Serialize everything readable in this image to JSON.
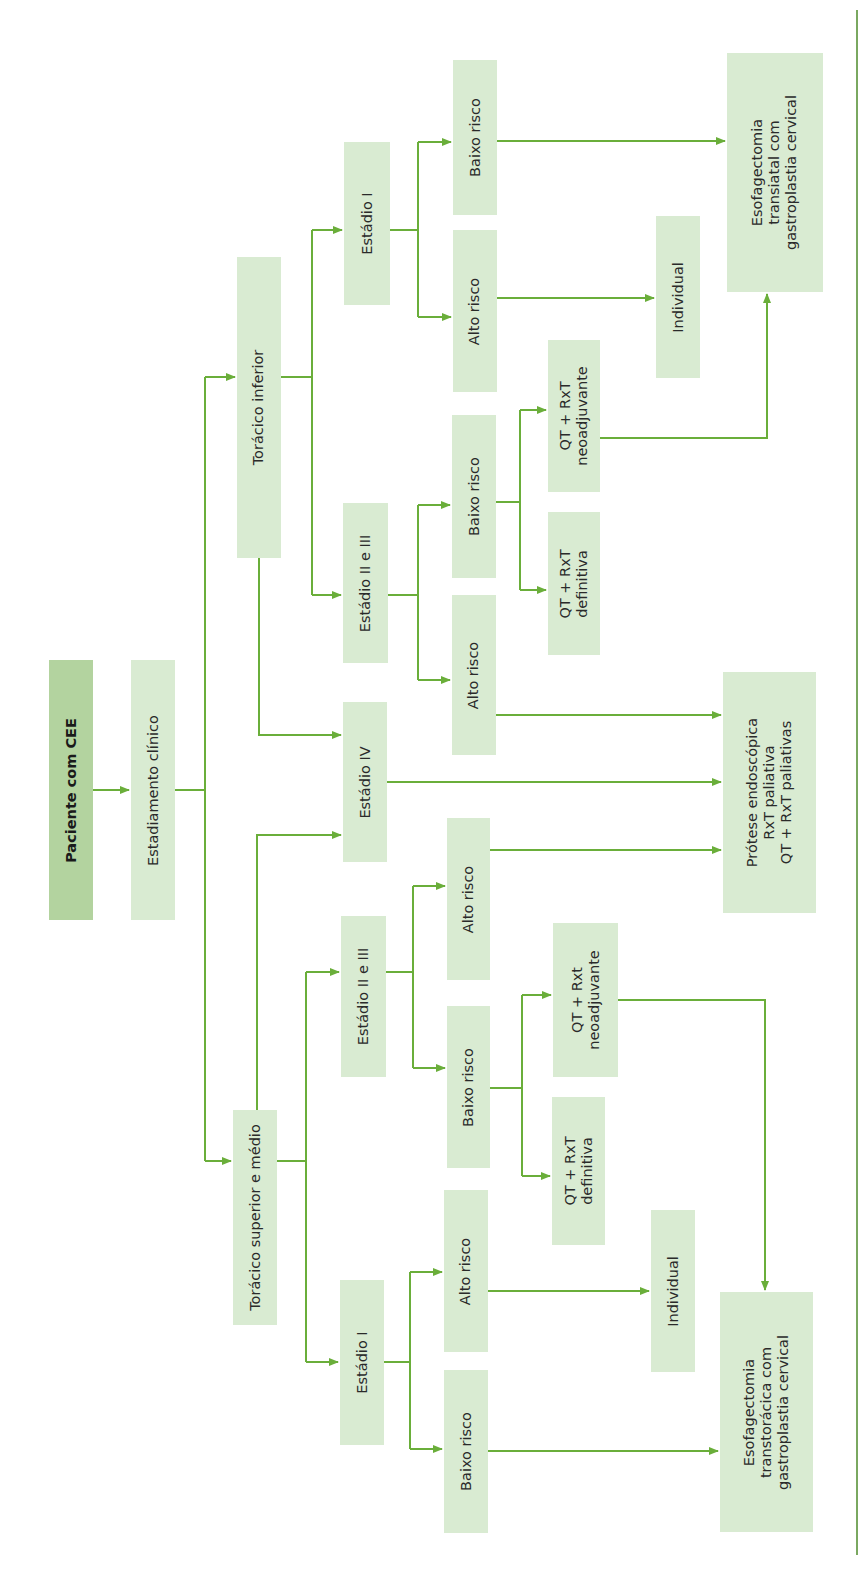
{
  "diagram": {
    "orientation": "rotated-90-ccw",
    "colors": {
      "root_box": "#b3d39f",
      "box": "#d9ebd2",
      "arrow": "#6aae3a",
      "text": "#2a2a2a"
    },
    "nodes": {
      "root": "Paciente com CEE",
      "staging": "Estadiamento clínico",
      "lower": "Torácico inferior",
      "upper_mid": "Torácico superior e médio",
      "lower_stage1": "Estádio I",
      "lower_stage23": "Estádio II e III",
      "stage4": "Estádio IV",
      "upper_stage23": "Estádio II e III",
      "upper_stage1": "Estádio I",
      "lower_s1_low": "Baixo risco",
      "lower_s1_high": "Alto risco",
      "lower_s23_low": "Baixo risco",
      "lower_s23_high": "Alto risco",
      "upper_s23_high": "Alto risco",
      "upper_s23_low": "Baixo risco",
      "upper_s1_high": "Alto risco",
      "upper_s1_low": "Baixo risco",
      "lower_neo": "QT + RxT\nneoadjuvante",
      "lower_def": "QT + RxT\ndefinitiva",
      "upper_neo": "QT + Rxt\nneoadjuvante",
      "upper_def": "QT + RxT\ndefinitiva",
      "lower_individual": "Individual",
      "upper_individual": "Individual",
      "transhiatal": "Esofagectomia\ntransiatal com\ngastroplastia cervical",
      "palliative": "Prótese endoscópica\nRxT paliativa\nQT + RxT paliativas",
      "transthoracic": "Esofagectomia\ntranstorácica com\ngastroplastia cervical"
    }
  }
}
